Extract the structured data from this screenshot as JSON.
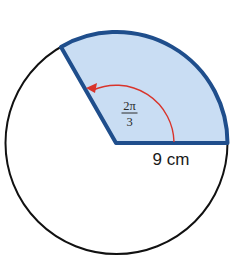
{
  "diagram": {
    "type": "circle-sector",
    "circle": {
      "center": [
        116,
        143
      ],
      "radius": 112,
      "stroke_color": "#111111"
    },
    "sector": {
      "start_angle_deg": 0,
      "end_angle_deg": 120,
      "fill_color": "#c9ddf3",
      "stroke_color": "#1f4e8c"
    },
    "angle_arrow": {
      "radius": 58,
      "color": "#d9342b"
    },
    "labels": {
      "angle": {
        "numerator": "2π",
        "denominator": "3"
      },
      "radius": "9 cm"
    }
  }
}
